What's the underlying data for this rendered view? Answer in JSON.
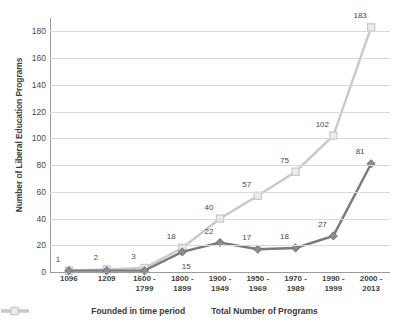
{
  "chart_data": {
    "type": "line",
    "title": "",
    "xlabel": "",
    "ylabel": "Number of Liberal Education Programs",
    "categories": [
      "1096",
      "1209",
      "1600 - 1799",
      "1800 - 1899",
      "1900 - 1949",
      "1950 - 1969",
      "1970 - 1989",
      "1990 - 1999",
      "2000 - 2013"
    ],
    "category_lines": [
      [
        "1096",
        ""
      ],
      [
        "1209",
        ""
      ],
      [
        "1600 -",
        "1799"
      ],
      [
        "1800 -",
        "1899"
      ],
      [
        "1900 -",
        "1949"
      ],
      [
        "1950 -",
        "1969"
      ],
      [
        "1970 -",
        "1989"
      ],
      [
        "1990 -",
        "1999"
      ],
      [
        "2000 -",
        "2013"
      ]
    ],
    "series": [
      {
        "name": "Founded in time period",
        "color": "#7a7a7a",
        "marker": "diamond",
        "values": [
          1,
          1,
          1,
          15,
          22,
          17,
          18,
          27,
          81
        ],
        "point_labels": [
          "",
          "",
          "",
          "15",
          "22",
          "17",
          "18",
          "27",
          "81"
        ]
      },
      {
        "name": "Total Number of Programs",
        "color": "#c9c9c9",
        "marker": "square",
        "values": [
          1,
          2,
          3,
          18,
          40,
          57,
          75,
          102,
          183
        ],
        "point_labels": [
          "1",
          "2",
          "3",
          "18",
          "40",
          "57",
          "75",
          "102",
          "183"
        ]
      }
    ],
    "yticks": [
      0,
      20,
      40,
      60,
      80,
      100,
      120,
      140,
      160,
      180
    ],
    "ylim": [
      0,
      190
    ],
    "grid": true,
    "legend_position": "bottom"
  },
  "legend": {
    "items": [
      {
        "label": "Founded in time period",
        "color": "#7a7a7a",
        "marker": "diamond"
      },
      {
        "label": "Total Number of Programs",
        "color": "#c9c9c9",
        "marker": "square"
      }
    ]
  }
}
